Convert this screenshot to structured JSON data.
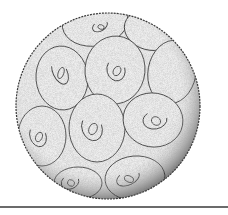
{
  "figure": {
    "style": "stippled pen illustration",
    "colors": {
      "background": "#ffffff",
      "fill": "#ececec",
      "outline": "#3a3a3a",
      "stipple": "#5a5a5a",
      "rule": "#6b6b6b"
    },
    "sphere": {
      "cx": 108,
      "cy": 106,
      "rx": 92,
      "ry": 93
    },
    "plates": [
      {
        "cx": 95,
        "cy": 22,
        "rx": 33,
        "ry": 24,
        "rot": -10,
        "ring": [
          100,
          26,
          8,
          5
        ]
      },
      {
        "cx": 150,
        "cy": 30,
        "rx": 26,
        "ry": 20,
        "rot": 15,
        "ring": null
      },
      {
        "cx": 62,
        "cy": 78,
        "rx": 26,
        "ry": 32,
        "rot": -5,
        "ring": [
          60,
          72,
          7,
          13
        ]
      },
      {
        "cx": 115,
        "cy": 70,
        "rx": 30,
        "ry": 34,
        "rot": 5,
        "ring": [
          116,
          70,
          9,
          11
        ]
      },
      {
        "cx": 172,
        "cy": 72,
        "rx": 24,
        "ry": 32,
        "rot": 10,
        "ring": null
      },
      {
        "cx": 97,
        "cy": 128,
        "rx": 28,
        "ry": 34,
        "rot": 0,
        "ring": [
          92,
          128,
          10,
          13
        ]
      },
      {
        "cx": 153,
        "cy": 120,
        "rx": 30,
        "ry": 27,
        "rot": 10,
        "ring": [
          155,
          120,
          12,
          9
        ]
      },
      {
        "cx": 42,
        "cy": 136,
        "rx": 24,
        "ry": 30,
        "rot": 0,
        "ring": [
          38,
          136,
          8,
          11
        ]
      },
      {
        "cx": 135,
        "cy": 178,
        "rx": 30,
        "ry": 22,
        "rot": -5,
        "ring": [
          128,
          178,
          12,
          7
        ]
      },
      {
        "cx": 78,
        "cy": 183,
        "rx": 24,
        "ry": 16,
        "rot": 0,
        "ring": [
          70,
          182,
          9,
          7
        ]
      }
    ]
  }
}
